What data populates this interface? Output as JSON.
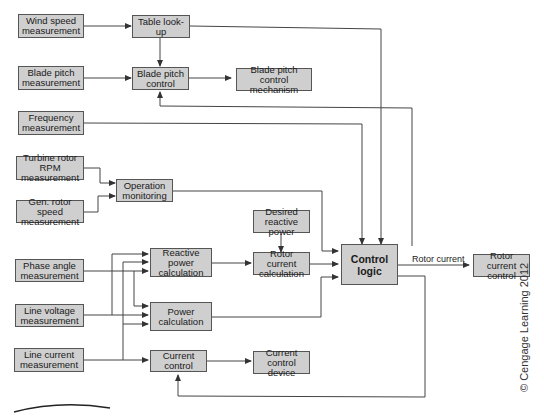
{
  "diagram": {
    "boxes": {
      "wind_speed": "Wind speed\nmeasurement",
      "table_lookup": "Table look-up",
      "blade_pitch_meas": "Blade pitch\nmeasurement",
      "blade_pitch_control": "Blade pitch\ncontrol",
      "blade_pitch_mech": "Blade pitch\ncontrol mechanism",
      "frequency": "Frequency\nmeasurement",
      "turbine_rpm": "Turbine rotor RPM\nmeasurement",
      "operation_monitoring": "Operation\nmonitoring",
      "gen_rotor_speed": "Gen. rotor speed\nmeasurement",
      "desired_reactive": "Desired\nreactive power",
      "phase_angle": "Phase angle\nmeasurement",
      "reactive_power_calc": "Reactive power\ncalculation",
      "rotor_current_calc": "Rotor current\ncalculation",
      "control_logic": "Control\nlogic",
      "rotor_current_control": "Rotor\ncurrent control",
      "line_voltage": "Line voltage\nmeasurement",
      "power_calc": "Power\ncalculation",
      "line_current": "Line current\nmeasurement",
      "current_control": "Current control",
      "current_control_device": "Current\ncontrol device"
    },
    "edge_labels": {
      "rotor_current": "Rotor current"
    },
    "copyright": "© Cengage Learning 2012",
    "colors": {
      "box_fill": "#cfcfcf",
      "box_border": "#555555",
      "line": "#444444"
    }
  }
}
